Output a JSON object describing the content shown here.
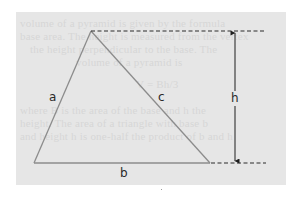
{
  "figure": {
    "type": "triangle-height-diagram",
    "background_color": "#e6e6e6",
    "line_color": "#8c8c8c",
    "dash_color": "#2b2b2b",
    "arrow_color": "#1e1e1e",
    "labels": {
      "side_left": "a",
      "side_right": "c",
      "side_bottom": "b",
      "height": "h"
    },
    "vertices": {
      "apex": [
        91,
        31
      ],
      "bottom_left": [
        34,
        163
      ],
      "bottom_right": [
        210,
        163
      ]
    },
    "height_marker": {
      "x": 235,
      "top_y": 31,
      "bottom_y": 163,
      "dashed_top_extent": [
        91,
        266
      ],
      "dashed_bottom_extent": [
        210,
        266
      ]
    }
  },
  "bleed_through_text": [
    "volume of a pyramid is given by the formula",
    "base area. The height is measured from the vertex",
    "the height perpendicular to the base. The",
    "volume of a pyramid is",
    "V = Bh/3",
    "where B is the area of the base and h the",
    "height. The area of a triangle with base b",
    "and height h is one-half the product of b and h"
  ]
}
